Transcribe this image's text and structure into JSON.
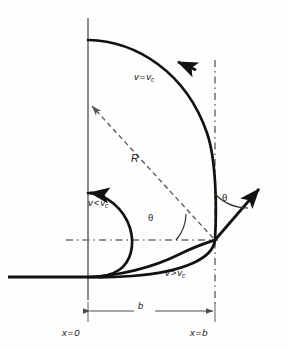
{
  "figure": {
    "name": "projectile-trajectories-critical-velocity-diagram",
    "background_color": "#fefefe",
    "stroke_color": "#111111",
    "dash_color": "#555555",
    "labels": {
      "curve_equal": {
        "var": "v",
        "op": "=",
        "var2": "v",
        "sub": "c",
        "text": "v = vc"
      },
      "curve_less": {
        "var": "v",
        "op": "<",
        "var2": "v",
        "sub": "c",
        "text": "v < vc"
      },
      "curve_greater": {
        "var": "v",
        "op": ">",
        "var2": "v",
        "sub": "c",
        "text": "v > vc"
      },
      "radius": "R",
      "distance": "b",
      "x_origin": {
        "var": "x",
        "op": "=",
        "value": "0",
        "text": "x = 0"
      },
      "x_b": {
        "var": "x",
        "op": "=",
        "value": "b",
        "text": "x = b"
      },
      "angle_inner": "θ",
      "angle_outer": "θ"
    },
    "geometry": {
      "axis_x_px": 88,
      "axis_top_px": 18,
      "axis_bottom_px": 300,
      "vertical_dashed_x_px": 215,
      "horizontal_dashed_y_px": 240,
      "baseline_y_px": 277,
      "dimension_line_y_px": 311,
      "radius_arrow_tip": [
        88,
        103
      ],
      "radius_arrow_tail": [
        215,
        240
      ],
      "velocity_arrow_tail": [
        215,
        240
      ],
      "velocity_arrow_tip": [
        262,
        186
      ],
      "angle_degrees_label": "θ"
    }
  }
}
